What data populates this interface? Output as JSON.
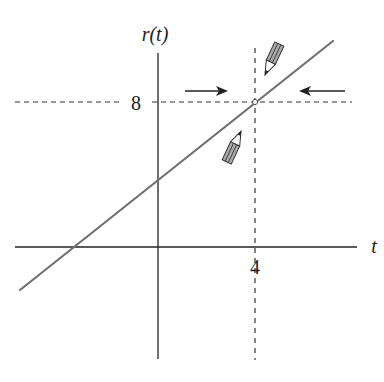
{
  "figure": {
    "type": "graph-of-function",
    "y_axis_label": "r(t)",
    "x_axis_label": "t",
    "tick_labels": {
      "y_value": "8",
      "x_value": "4"
    },
    "point": {
      "t": 4,
      "r": 8,
      "style": "open-circle"
    },
    "line": {
      "color": "#707070",
      "slope_note": "increasing line, crosses r-axis below 8 and t-axis left of origin"
    },
    "axis_color": "#222222",
    "guide_style": "dashed",
    "arrows": [
      {
        "direction": "right",
        "meaning": "approach from left"
      },
      {
        "direction": "left",
        "meaning": "approach from right"
      }
    ],
    "pencils": [
      {
        "position": "above-right",
        "pointing": "down-left toward point"
      },
      {
        "position": "below-left",
        "pointing": "up-right toward point"
      }
    ]
  }
}
